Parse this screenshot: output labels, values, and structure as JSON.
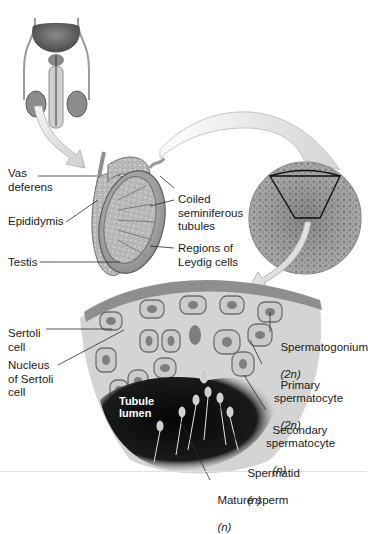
{
  "figure": {
    "panels": [
      "male reproductive system overview",
      "testis and epididymis",
      "seminiferous tubule cross-section",
      "tubule wall detail"
    ]
  },
  "labels": {
    "vas_deferens": "Vas\ndeferens",
    "epididymis": "Epididymis",
    "testis": "Testis",
    "coiled_tubules": "Coiled\nseminiferous\ntubules",
    "leydig": "Regions of\nLeydig cells",
    "sertoli_cell": "Sertoli\ncell",
    "sertoli_nucleus": "Nucleus\nof Sertoli\ncell",
    "tubule_lumen": "Tubule\nlumen",
    "spermatogonium": {
      "name": "Spermatogonium",
      "ploidy": "(2n)"
    },
    "primary": {
      "name": "Primary\nspermatocyte",
      "ploidy": "(2n)"
    },
    "secondary": {
      "name": "Secondary\nspermatocyte",
      "ploidy": "(n)"
    },
    "spermatid": {
      "name": "Spermatid",
      "ploidy": "(n)"
    },
    "mature_sperm": {
      "name": "Mature sperm",
      "ploidy": "(n)"
    }
  },
  "colors": {
    "background": "#ffffff",
    "tissue": "#b9b9b9",
    "tissue_dark": "#6f6f6f",
    "lumen": "#111111",
    "text": "#1a1a1a",
    "arrow": "#e6e6e6"
  }
}
